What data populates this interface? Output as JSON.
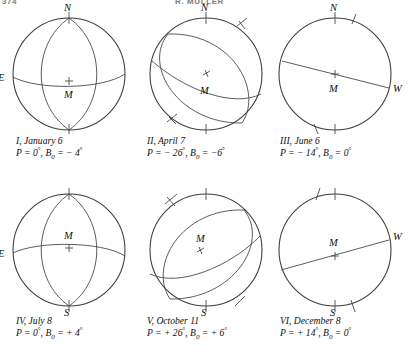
{
  "header": {
    "left": "374",
    "center": "R. MULLER"
  },
  "figure": {
    "center_marker_label": "M",
    "axis_labels": {
      "north": "N",
      "south": "S",
      "east": "E",
      "west": "W"
    }
  },
  "panels": [
    {
      "id": "I",
      "caption_line1": "I, January 6",
      "caption_line2_prefix": "P = 0",
      "caption_P": "0",
      "caption_B": "− 4",
      "P_value": 0,
      "B0_value": -4,
      "show_east": true,
      "show_west": false,
      "show_north": true,
      "show_south": false,
      "m_above_cross": false,
      "equator_style": "curve",
      "equator_bulge": "down",
      "meridian": true,
      "tick_axis": false
    },
    {
      "id": "II",
      "caption_line1": "II, April 7",
      "caption_P": "− 26",
      "caption_B": "−6",
      "P_value": -26,
      "B0_value": -6,
      "show_east": false,
      "show_west": false,
      "show_north": true,
      "show_south": false,
      "m_above_cross": false,
      "equator_style": "curve",
      "equator_bulge": "down",
      "meridian": true,
      "tick_axis": true
    },
    {
      "id": "III",
      "caption_line1": "III, June 6",
      "caption_P": "− 14",
      "caption_B": "0",
      "P_value": -14,
      "B0_value": 0,
      "show_east": false,
      "show_west": true,
      "show_north": true,
      "show_south": false,
      "m_above_cross": true,
      "equator_style": "straight",
      "equator_bulge": "none",
      "meridian": false,
      "tick_axis": true
    },
    {
      "id": "IV",
      "caption_line1": "IV, July 8",
      "caption_P": "0",
      "caption_B": "+ 4",
      "P_value": 0,
      "B0_value": 4,
      "show_east": true,
      "show_west": false,
      "show_north": false,
      "show_south": true,
      "m_above_cross": true,
      "equator_style": "curve",
      "equator_bulge": "up",
      "meridian": true,
      "tick_axis": false
    },
    {
      "id": "V",
      "caption_line1": "V, October 11",
      "caption_P": "+ 26",
      "caption_B": "+ 6",
      "P_value": 26,
      "B0_value": 6,
      "show_east": false,
      "show_west": false,
      "show_north": false,
      "show_south": true,
      "m_above_cross": true,
      "equator_style": "curve",
      "equator_bulge": "up",
      "meridian": true,
      "tick_axis": true
    },
    {
      "id": "VI",
      "caption_line1": "VI, December 8",
      "caption_P": "+ 14",
      "caption_B": "0",
      "P_value": 14,
      "B0_value": 0,
      "show_east": false,
      "show_west": true,
      "show_north": false,
      "show_south": true,
      "m_above_cross": false,
      "equator_style": "straight",
      "equator_bulge": "none",
      "meridian": false,
      "tick_axis": true
    }
  ],
  "caption_parts": {
    "P_label": "P = ",
    "B_label": "B",
    "B_sub": "0",
    "eq": " = ",
    "degree": "°",
    "comma": ", "
  }
}
